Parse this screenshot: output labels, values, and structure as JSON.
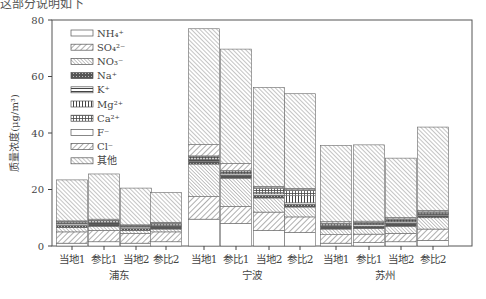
{
  "page": {
    "top_text": "这部分说明如下",
    "caption": ""
  },
  "chart_data": {
    "type": "stacked_bar",
    "title": "",
    "xlabel": "",
    "ylabel": "质量浓度(μg/m³)",
    "ylim": [
      0,
      80
    ],
    "yticks": [
      0,
      20,
      40,
      60,
      80
    ],
    "grid": false,
    "legend_position": "upper-left-inside",
    "groups": [
      {
        "name": "浦东",
        "categories": [
          "当地1",
          "参比1",
          "当地2",
          "参比2"
        ]
      },
      {
        "name": "宁波",
        "categories": [
          "当地1",
          "参比1",
          "当地2",
          "参比2"
        ]
      },
      {
        "name": "苏州",
        "categories": [
          "当地1",
          "参比1",
          "当地2",
          "参比2"
        ]
      }
    ],
    "categories": [
      "浦东-当地1",
      "浦东-参比1",
      "浦东-当地2",
      "浦东-参比2",
      "宁波-当地1",
      "宁波-参比1",
      "宁波-当地2",
      "宁波-参比2",
      "苏州-当地1",
      "苏州-参比1",
      "苏州-当地2",
      "苏州-参比2"
    ],
    "series": [
      {
        "name": "NH₄⁺",
        "pattern": "empty",
        "values": [
          1.0,
          1.5,
          1.0,
          1.5,
          9.5,
          8.0,
          5.5,
          4.8,
          1.0,
          1.2,
          1.5,
          2.0
        ]
      },
      {
        "name": "SO₄²⁻",
        "pattern": "diag-fwd",
        "values": [
          4.0,
          4.0,
          3.5,
          3.5,
          8.0,
          6.0,
          6.5,
          5.5,
          3.0,
          3.0,
          3.0,
          4.0
        ]
      },
      {
        "name": "NO₃⁻",
        "pattern": "diag-back-dense",
        "values": [
          1.5,
          1.5,
          1.0,
          1.0,
          11.5,
          10.0,
          5.0,
          3.5,
          2.0,
          2.0,
          2.5,
          4.0
        ]
      },
      {
        "name": "Na⁺",
        "pattern": "crosshatch",
        "values": [
          0.8,
          0.8,
          0.7,
          0.8,
          1.0,
          1.0,
          1.0,
          1.0,
          0.8,
          0.8,
          1.0,
          0.8
        ]
      },
      {
        "name": "K⁺",
        "pattern": "horizontal",
        "values": [
          0.5,
          0.5,
          0.5,
          0.5,
          0.5,
          0.5,
          0.5,
          0.5,
          0.5,
          0.5,
          0.5,
          0.5
        ]
      },
      {
        "name": "Mg²⁺",
        "pattern": "vertical",
        "values": [
          0.2,
          0.2,
          0.2,
          0.2,
          0.3,
          0.3,
          0.5,
          2.5,
          0.2,
          0.2,
          0.2,
          0.2
        ]
      },
      {
        "name": "Ca²⁺",
        "pattern": "grid",
        "values": [
          0.5,
          0.5,
          0.3,
          0.5,
          1.0,
          0.8,
          1.5,
          2.0,
          0.5,
          0.5,
          0.8,
          0.5
        ]
      },
      {
        "name": "F⁻",
        "pattern": "empty",
        "values": [
          0.1,
          0.1,
          0.1,
          0.1,
          0.1,
          0.1,
          0.1,
          0.1,
          0.1,
          0.1,
          0.1,
          0.1
        ]
      },
      {
        "name": "Cl⁻",
        "pattern": "diag-fwd",
        "values": [
          0.3,
          0.4,
          0.2,
          0.3,
          4.0,
          2.5,
          0.5,
          0.5,
          0.5,
          0.5,
          0.5,
          0.5
        ]
      },
      {
        "name": "其他",
        "pattern": "diag-back",
        "values": [
          14.5,
          16.0,
          13.0,
          10.5,
          41.0,
          40.5,
          35.0,
          33.5,
          27.0,
          27.0,
          21.0,
          29.5
        ]
      }
    ],
    "totals": [
      23.4,
      25.5,
      20.5,
      19.4,
      76.9,
      69.7,
      56.1,
      54.4,
      35.6,
      35.8,
      31.1,
      42.1
    ]
  }
}
